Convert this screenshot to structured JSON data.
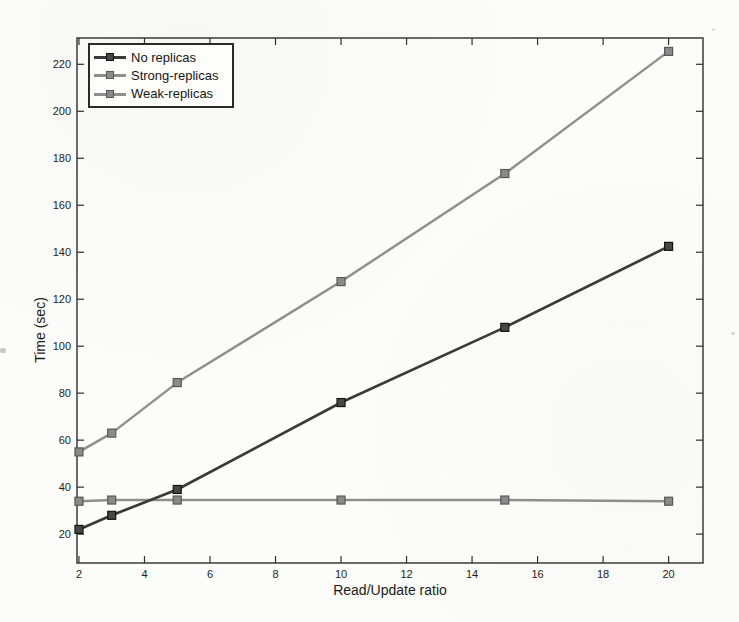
{
  "figure": {
    "background": "#fcfcfa",
    "frame_color": "#2e2e2e",
    "text_color": "#1c1c1c"
  },
  "chart_data": {
    "type": "line",
    "title": "",
    "xlabel": "Read/Update ratio",
    "ylabel": "Time (sec)",
    "x": [
      2,
      3,
      5,
      10,
      15,
      20
    ],
    "series": [
      {
        "name": "No replicas",
        "values": [
          22,
          28,
          39,
          76,
          108,
          142.5
        ],
        "line_color": "#3a3a3a",
        "line_width": 2.7,
        "marker_fill": "#474747",
        "marker_edge": "#141414"
      },
      {
        "name": "Strong-replicas",
        "values": [
          55,
          63,
          84.5,
          127.5,
          173.5,
          225.5
        ],
        "line_color": "#8e8e8e",
        "line_width": 2.4,
        "marker_fill": "#8a8a8a",
        "marker_edge": "#585858"
      },
      {
        "name": "Weak-replicas",
        "values": [
          34,
          34.5,
          34.5,
          34.5,
          34.5,
          34
        ],
        "line_color": "#8e8e8e",
        "line_width": 2.4,
        "marker_fill": "#8a8a8a",
        "marker_edge": "#585858"
      }
    ],
    "xticks": [
      2,
      4,
      6,
      8,
      10,
      12,
      14,
      16,
      18,
      20
    ],
    "yticks": [
      20,
      40,
      60,
      80,
      100,
      120,
      140,
      160,
      180,
      200,
      220
    ],
    "xlim": [
      1.94,
      21.05
    ],
    "ylim": [
      7.7,
      231.2
    ],
    "grid": false,
    "legend_position": "top-left",
    "marker_shape": "square",
    "marker_size": 8
  }
}
